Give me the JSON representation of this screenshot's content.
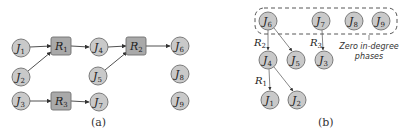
{
  "figure": {
    "panel_a": {
      "caption": "(a)",
      "job_nodes": [
        {
          "id": "J1",
          "base": "J",
          "sub": "1",
          "x": 21,
          "y": 48
        },
        {
          "id": "J2",
          "base": "J",
          "sub": "2",
          "x": 21,
          "y": 77
        },
        {
          "id": "J3",
          "base": "J",
          "sub": "3",
          "x": 21,
          "y": 101
        },
        {
          "id": "J4",
          "base": "J",
          "sub": "4",
          "x": 99,
          "y": 47
        },
        {
          "id": "J5",
          "base": "J",
          "sub": "5",
          "x": 98,
          "y": 76
        },
        {
          "id": "J7",
          "base": "J",
          "sub": "7",
          "x": 99,
          "y": 102
        },
        {
          "id": "J6",
          "base": "J",
          "sub": "6",
          "x": 180,
          "y": 46
        },
        {
          "id": "J8",
          "base": "J",
          "sub": "8",
          "x": 180,
          "y": 74
        },
        {
          "id": "J9",
          "base": "J",
          "sub": "9",
          "x": 180,
          "y": 101
        }
      ],
      "resource_nodes": [
        {
          "id": "R1",
          "base": "R",
          "sub": "1",
          "x": 61,
          "y": 46
        },
        {
          "id": "R2",
          "base": "R",
          "sub": "2",
          "x": 136,
          "y": 46
        },
        {
          "id": "R3",
          "base": "R",
          "sub": "3",
          "x": 61,
          "y": 101
        }
      ],
      "edges": [
        {
          "from": "J1",
          "to": "R1"
        },
        {
          "from": "J2",
          "to": "R1"
        },
        {
          "from": "R1",
          "to": "J4"
        },
        {
          "from": "J4",
          "to": "R2"
        },
        {
          "from": "J5",
          "to": "R2"
        },
        {
          "from": "R2",
          "to": "J6"
        },
        {
          "from": "J3",
          "to": "R3"
        },
        {
          "from": "R3",
          "to": "J7"
        }
      ]
    },
    "panel_b": {
      "caption": "(b)",
      "job_nodes": [
        {
          "id": "J6",
          "base": "J",
          "sub": "6",
          "x": 268,
          "y": 21
        },
        {
          "id": "J7",
          "base": "J",
          "sub": "7",
          "x": 321,
          "y": 21
        },
        {
          "id": "J8",
          "base": "J",
          "sub": "8",
          "x": 354,
          "y": 21
        },
        {
          "id": "J9",
          "base": "J",
          "sub": "9",
          "x": 381,
          "y": 21
        },
        {
          "id": "J4",
          "base": "J",
          "sub": "4",
          "x": 268,
          "y": 60
        },
        {
          "id": "J5",
          "base": "J",
          "sub": "5",
          "x": 296,
          "y": 60
        },
        {
          "id": "J3",
          "base": "J",
          "sub": "3",
          "x": 324,
          "y": 60
        },
        {
          "id": "J1",
          "base": "J",
          "sub": "1",
          "x": 270,
          "y": 100
        },
        {
          "id": "J2",
          "base": "J",
          "sub": "2",
          "x": 297,
          "y": 100
        }
      ],
      "edges": [
        {
          "from": "J6",
          "to": "J4",
          "label": "R2"
        },
        {
          "from": "J6",
          "to": "J5"
        },
        {
          "from": "J7",
          "to": "J3",
          "label": "R3"
        },
        {
          "from": "J4",
          "to": "J1",
          "label": "R1"
        },
        {
          "from": "J4",
          "to": "J2"
        }
      ],
      "edge_labels": [
        {
          "base": "R",
          "sub": "2",
          "x": 254,
          "y": 46
        },
        {
          "base": "R",
          "sub": "3",
          "x": 310,
          "y": 46
        },
        {
          "base": "R",
          "sub": "1",
          "x": 255,
          "y": 84
        }
      ],
      "zero_indegree_group": {
        "members": [
          "J6",
          "J7",
          "J8",
          "J9"
        ],
        "annotation_line1": "Zero in-degree",
        "annotation_line2": "phases"
      }
    }
  }
}
